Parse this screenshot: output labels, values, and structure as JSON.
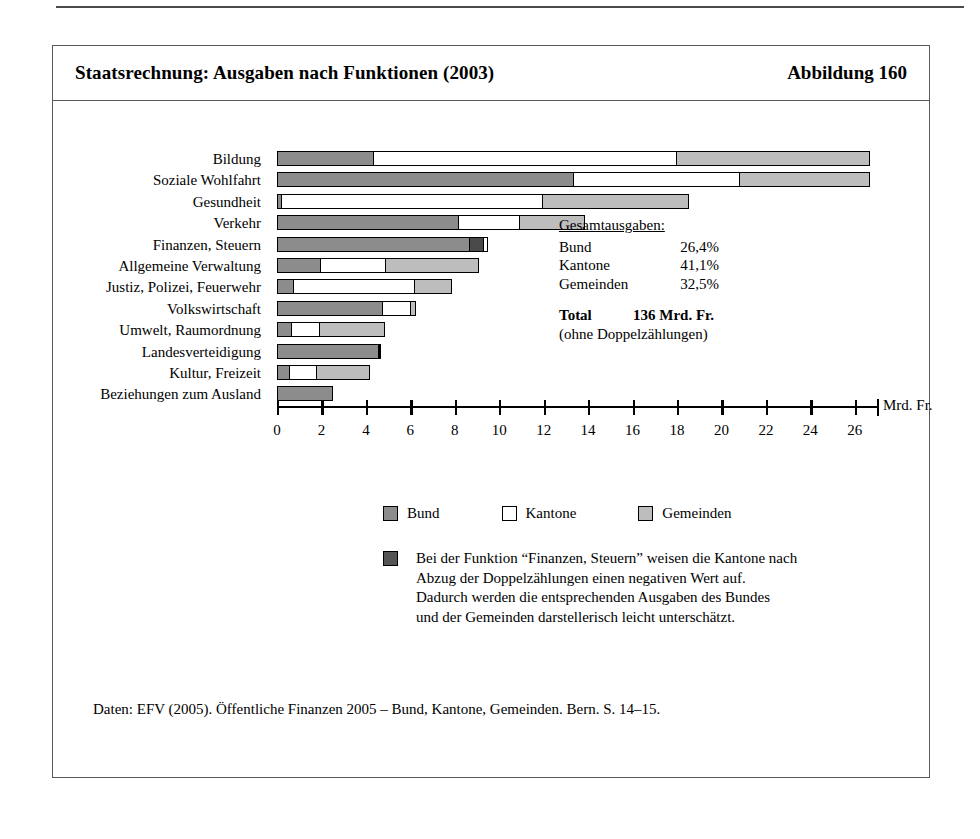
{
  "figure": {
    "title": "Staatsrechnung: Ausgaben nach Funktionen (2003)",
    "number_label": "Abbildung 160",
    "source": "Daten: EFV (2005). Öffentliche Finanzen 2005 – Bund, Kantone, Gemeinden. Bern. S. 14–15."
  },
  "totals": {
    "heading": "Gesamtausgaben:",
    "rows": [
      {
        "label": "Bund",
        "value": "26,4%"
      },
      {
        "label": "Kantone",
        "value": "41,1%"
      },
      {
        "label": "Gemeinden",
        "value": "32,5%"
      }
    ],
    "total_label": "Total",
    "total_value": "136 Mrd. Fr.",
    "total_note": "(ohne Doppelzählungen)"
  },
  "legend": {
    "items": [
      {
        "key": "bund",
        "label": "Bund"
      },
      {
        "key": "kantone",
        "label": "Kantone"
      },
      {
        "key": "gemeinden",
        "label": "Gemeinden"
      }
    ]
  },
  "footnote": {
    "swatch_label": "negativ-wert-swatch",
    "lines": [
      "Bei der Funktion “Finanzen, Steuern” weisen die Kantone nach",
      "Abzug der Doppelzählungen einen negativen Wert auf.",
      "Dadurch werden die entsprechenden Ausgaben des Bundes",
      "und der Gemeinden darstellerisch leicht unterschätzt."
    ]
  },
  "colors": {
    "bund": "#8c8c8c",
    "kantone": "#ffffff",
    "gemeinden": "#bdbdbd",
    "negativ": "#4a4a4a",
    "outline": "#000000"
  },
  "chart_data": {
    "type": "bar",
    "orientation": "horizontal",
    "stacked": true,
    "title": "Staatsrechnung: Ausgaben nach Funktionen (2003)",
    "xlabel": "Mrd. Fr.",
    "ylabel": "",
    "xlim": [
      0,
      27
    ],
    "xticks": [
      0,
      2,
      4,
      6,
      8,
      10,
      12,
      14,
      16,
      18,
      20,
      22,
      24,
      26
    ],
    "xtick_labels": [
      "0",
      "2",
      "4",
      "6",
      "8",
      "10",
      "12",
      "14",
      "16",
      "18",
      "20",
      "22",
      "24",
      "26"
    ],
    "grid": false,
    "legend_position": "bottom",
    "unit": "Mrd. Fr.",
    "categories": [
      "Bildung",
      "Soziale Wohlfahrt",
      "Gesundheit",
      "Verkehr",
      "Finanzen, Steuern",
      "Allgemeine Verwaltung",
      "Justiz, Polizei, Feuerwehr",
      "Volkswirtschaft",
      "Umwelt, Raumordnung",
      "Landesverteidigung",
      "Kultur, Freizeit",
      "Beziehungen zum Ausland"
    ],
    "series": [
      {
        "name": "Bund",
        "key": "bund",
        "values": [
          4.4,
          13.4,
          0.25,
          8.2,
          8.7,
          2.0,
          0.8,
          4.8,
          0.7,
          4.6,
          0.6,
          2.5
        ]
      },
      {
        "name": "Kantone",
        "key": "kantone",
        "values": [
          13.7,
          7.5,
          11.8,
          2.8,
          0.2,
          3.0,
          5.5,
          1.3,
          1.3,
          0.1,
          1.3,
          0.0
        ]
      },
      {
        "name": "Gemeinden",
        "key": "gemeinden",
        "values": [
          8.7,
          5.9,
          6.6,
          3.0,
          0.0,
          4.2,
          1.7,
          0.3,
          3.0,
          0.1,
          2.4,
          0.0
        ]
      },
      {
        "name": "Negativer Kantonswert (Finanzen, Steuern)",
        "key": "negativ",
        "values": [
          0,
          0,
          0,
          0,
          0.7,
          0,
          0,
          0,
          0,
          0,
          0,
          0
        ]
      }
    ],
    "bar_totals": [
      26.8,
      26.8,
      18.7,
      14.0,
      9.6,
      9.2,
      8.0,
      6.4,
      5.0,
      4.8,
      4.3,
      2.5
    ],
    "segment_order": [
      "bund",
      "negativ",
      "kantone",
      "gemeinden"
    ]
  }
}
